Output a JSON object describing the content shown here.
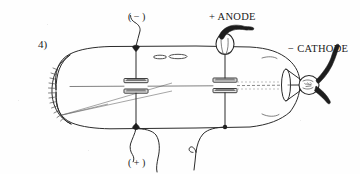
{
  "figure": {
    "item_number": "4)",
    "type": "cathode-ray-tube-schematic",
    "background_color": "#fefefe",
    "ink_color": "#2b2b2b"
  },
  "labels": {
    "negative_terminal": "( − )",
    "positive_terminal": "( + )",
    "anode": "+ ANODE",
    "cathode": "− CATHODE"
  },
  "components": {
    "tube_name": "evacuated-glass-tube",
    "left_dome_name": "rounded-left-end-with-hatching",
    "right_bulb_name": "right-bulb-electrode-housing",
    "plate_pair_left_name": "left-deflecting-plate-pair",
    "plate_pair_right_name": "right-deflecting-plate-pair",
    "beam_name": "electron-beam-path",
    "target_cone_name": "target-cone",
    "slot_marks": "slit-apertures"
  }
}
